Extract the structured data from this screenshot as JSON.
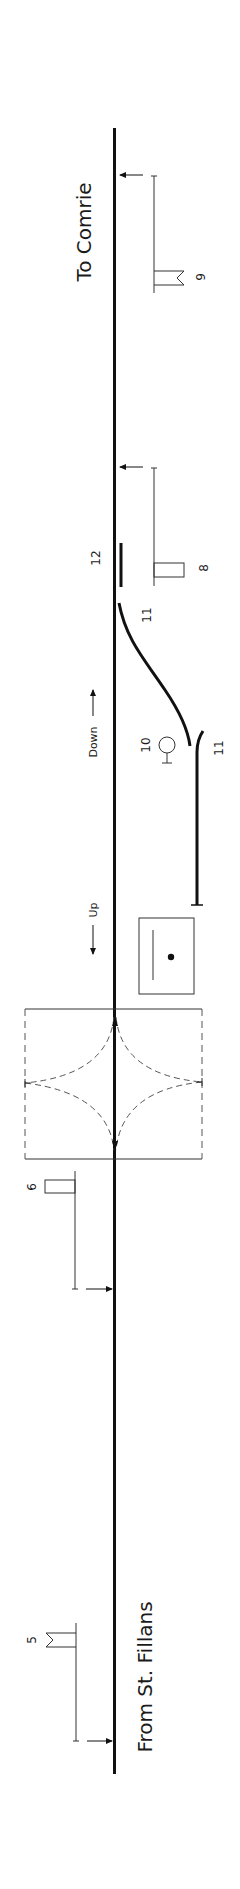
{
  "diagram": {
    "orientation": "rotated 90° (line runs vertically)",
    "colors": {
      "line": "#111111",
      "thin": "#333333",
      "dashed": "#555555",
      "background": "#ffffff"
    },
    "destinations": {
      "to": "To Comrie",
      "from": "From St. Fillans"
    },
    "directions": {
      "down": "Down",
      "up": "Up"
    },
    "signals": [
      {
        "number": "9",
        "type": "distant-fishtail",
        "direction": "up"
      },
      {
        "number": "8",
        "type": "home-square",
        "direction": "up"
      },
      {
        "number": "10",
        "type": "ground-disc"
      },
      {
        "number": "6",
        "type": "home-square",
        "direction": "down"
      },
      {
        "number": "5",
        "type": "distant-fishtail",
        "direction": "down"
      }
    ],
    "points": [
      {
        "number": "11",
        "label_position": "main-line end"
      },
      {
        "number": "11",
        "label_position": "siding end"
      }
    ],
    "other": [
      {
        "number": "12",
        "type": "facing-point-lock / bar"
      }
    ],
    "structures": [
      {
        "name": "signal-box",
        "type": "lever frame"
      },
      {
        "name": "level-crossing",
        "type": "gated crossing with dashed gate swings"
      }
    ]
  }
}
